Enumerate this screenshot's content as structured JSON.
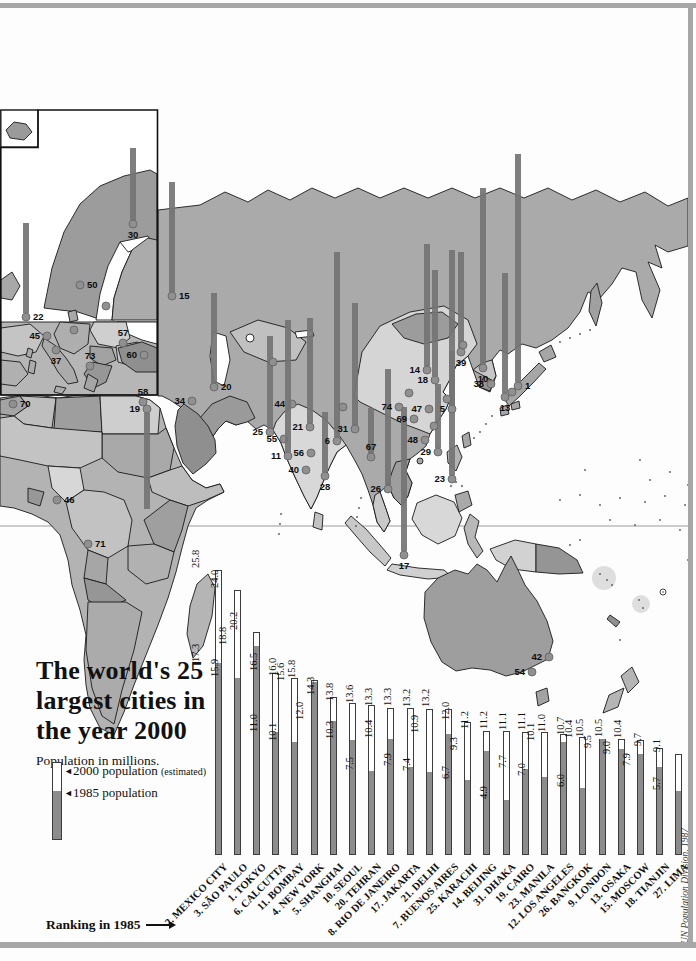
{
  "header": {
    "title_lines": [
      "The world's 25",
      "largest cities in",
      "the year 2000"
    ],
    "subtitle": "Population in millions."
  },
  "legend": {
    "marker": "◄",
    "y2000": "2000 population",
    "y2000_note": "(estimated)",
    "y1985": "1985 population"
  },
  "footnote": {
    "ranking_label": "Ranking in 1985",
    "credit": "UN Population Division, 1987"
  },
  "colors": {
    "frame": "#a7a7a7",
    "land_base": "#aaaaaa",
    "land_light": "#d6d6d6",
    "bar_2000_fill": "#ffffff",
    "bar_1985_fill": "#8c8c8c",
    "bar_outline": "#3c3c3c",
    "map_bar": "#747474",
    "city_dot": "#909090",
    "text": "#111111"
  },
  "chart_data": {
    "type": "bar",
    "title": "The world's 25 largest cities in the year 2000",
    "ylabel": "Population in millions",
    "legend_position": "left",
    "series": [
      {
        "name": "2000 population (estimated)"
      },
      {
        "name": "1985 population"
      }
    ],
    "cities": [
      {
        "label": "2. MEXICO CITY",
        "pop2000": 25.8,
        "pop1985": 17.3
      },
      {
        "label": "3. SÃO PAULO",
        "pop2000": 24.0,
        "pop1985": 15.9
      },
      {
        "label": "1. TOKYO",
        "pop2000": 20.2,
        "pop1985": 18.8
      },
      {
        "label": "6. CALCUTTA",
        "pop2000": 16.5,
        "pop1985": 11.0
      },
      {
        "label": "11. BOMBAY",
        "pop2000": 16.0,
        "pop1985": 10.1
      },
      {
        "label": "4. NEW YORK",
        "pop2000": 15.8,
        "pop1985": 15.6
      },
      {
        "label": "5. SHANGHAI",
        "pop2000": 14.3,
        "pop1985": 12.0
      },
      {
        "label": "10. SEOUL",
        "pop2000": 13.8,
        "pop1985": 10.3
      },
      {
        "label": "20. TEHRAN",
        "pop2000": 13.6,
        "pop1985": 7.5
      },
      {
        "label": "8. RIO DE JANEIRO",
        "pop2000": 13.3,
        "pop1985": 10.4
      },
      {
        "label": "17. JAKARTA",
        "pop2000": 13.3,
        "pop1985": 7.9
      },
      {
        "label": "21. DELHI",
        "pop2000": 13.2,
        "pop1985": 7.4
      },
      {
        "label": "7. BUENOS AIRES",
        "pop2000": 13.2,
        "pop1985": 10.9
      },
      {
        "label": "25. KARACHI",
        "pop2000": 12.0,
        "pop1985": 6.7
      },
      {
        "label": "14. BEIJING",
        "pop2000": 11.2,
        "pop1985": 9.3
      },
      {
        "label": "31. DHAKA",
        "pop2000": 11.2,
        "pop1985": 4.9
      },
      {
        "label": "19. CAIRO",
        "pop2000": 11.1,
        "pop1985": 7.7
      },
      {
        "label": "23. MANILA",
        "pop2000": 11.1,
        "pop1985": 7.0
      },
      {
        "label": "12. LOS ANGELES",
        "pop2000": 11.0,
        "pop1985": 10.1
      },
      {
        "label": "26. BANGKOK",
        "pop2000": 10.7,
        "pop1985": 6.0
      },
      {
        "label": "9. LONDON",
        "pop2000": 10.5,
        "pop1985": 10.4
      },
      {
        "label": "13. OSAKA",
        "pop2000": 10.5,
        "pop1985": 9.5
      },
      {
        "label": "15. MOSCOW",
        "pop2000": 10.4,
        "pop1985": 9.0
      },
      {
        "label": "18. TIANJIN",
        "pop2000": 9.7,
        "pop1985": 7.9
      },
      {
        "label": "27. LIMA",
        "pop2000": 9.1,
        "pop1985": 5.7
      }
    ]
  },
  "map": {
    "markers": [
      {
        "n": "30",
        "x": 133,
        "y": 224,
        "bar": 72,
        "side": "below"
      },
      {
        "n": "22",
        "x": 26,
        "y": 317,
        "bar": 90,
        "side": "right"
      },
      {
        "n": "50",
        "x": 80,
        "y": 285,
        "bar": 0,
        "side": "right"
      },
      {
        "n": "45",
        "x": 47,
        "y": 336,
        "bar": 0,
        "side": "left"
      },
      {
        "n": "37",
        "x": 56,
        "y": 350,
        "bar": 0,
        "side": "below"
      },
      {
        "n": "73",
        "x": 90,
        "y": 366,
        "bar": 0,
        "side": "above"
      },
      {
        "n": "57",
        "x": 123,
        "y": 343,
        "bar": 0,
        "side": "above"
      },
      {
        "n": "60",
        "x": 144,
        "y": 355,
        "bar": 0,
        "side": "left"
      },
      {
        "n": "",
        "x": 74,
        "y": 330,
        "bar": 0,
        "side": "left"
      },
      {
        "n": "",
        "x": 106,
        "y": 306,
        "bar": 0,
        "side": "left"
      },
      {
        "n": "15",
        "x": 172,
        "y": 296,
        "bar": 110,
        "side": "right"
      },
      {
        "n": "58",
        "x": 143,
        "y": 402,
        "bar": 0,
        "side": "above"
      },
      {
        "n": "19",
        "x": 147,
        "y": 409,
        "bar": -96,
        "side": "left"
      },
      {
        "n": "34",
        "x": 192,
        "y": 401,
        "bar": 0,
        "side": "left"
      },
      {
        "n": "70",
        "x": 13,
        "y": 404,
        "bar": 0,
        "side": "right"
      },
      {
        "n": "46",
        "x": 57,
        "y": 500,
        "bar": 0,
        "side": "right"
      },
      {
        "n": "71",
        "x": 88,
        "y": 544,
        "bar": 0,
        "side": "right"
      },
      {
        "n": "20",
        "x": 214,
        "y": 387,
        "bar": 90,
        "side": "right"
      },
      {
        "n": "44",
        "x": 292,
        "y": 404,
        "bar": 0,
        "side": "left"
      },
      {
        "n": "21",
        "x": 310,
        "y": 427,
        "bar": 105,
        "side": "left"
      },
      {
        "n": "25",
        "x": 270,
        "y": 432,
        "bar": 92,
        "side": "left"
      },
      {
        "n": "55",
        "x": 284,
        "y": 439,
        "bar": 0,
        "side": "left"
      },
      {
        "n": "11",
        "x": 288,
        "y": 456,
        "bar": 132,
        "side": "left"
      },
      {
        "n": "56",
        "x": 311,
        "y": 453,
        "bar": 0,
        "side": "left"
      },
      {
        "n": "40",
        "x": 306,
        "y": 470,
        "bar": 0,
        "side": "left"
      },
      {
        "n": "28",
        "x": 325,
        "y": 476,
        "bar": 60,
        "side": "below"
      },
      {
        "n": "6",
        "x": 337,
        "y": 441,
        "bar": 185,
        "side": "left"
      },
      {
        "n": "31",
        "x": 355,
        "y": 429,
        "bar": 122,
        "side": "left"
      },
      {
        "n": "67",
        "x": 371,
        "y": 457,
        "bar": 45,
        "side": "above"
      },
      {
        "n": "26",
        "x": 388,
        "y": 489,
        "bar": 116,
        "side": "left"
      },
      {
        "n": "17",
        "x": 404,
        "y": 555,
        "bar": 144,
        "side": "below"
      },
      {
        "n": "23",
        "x": 452,
        "y": 479,
        "bar": 124,
        "side": "left"
      },
      {
        "n": "29",
        "x": 438,
        "y": 452,
        "bar": 64,
        "side": "left"
      },
      {
        "n": "48",
        "x": 425,
        "y": 440,
        "bar": 0,
        "side": "left"
      },
      {
        "n": "47",
        "x": 429,
        "y": 409,
        "bar": 0,
        "side": "left"
      },
      {
        "n": "69",
        "x": 414,
        "y": 419,
        "bar": 0,
        "side": "left"
      },
      {
        "n": "74",
        "x": 399,
        "y": 407,
        "bar": 0,
        "side": "left"
      },
      {
        "n": "5",
        "x": 452,
        "y": 409,
        "bar": 155,
        "side": "left"
      },
      {
        "n": "14",
        "x": 427,
        "y": 370,
        "bar": 122,
        "side": "left"
      },
      {
        "n": "18",
        "x": 435,
        "y": 380,
        "bar": 106,
        "side": "left"
      },
      {
        "n": "39",
        "x": 461,
        "y": 352,
        "bar": 96,
        "side": "below"
      },
      {
        "n": "10",
        "x": 483,
        "y": 368,
        "bar": 176,
        "side": "below"
      },
      {
        "n": "38",
        "x": 491,
        "y": 384,
        "bar": 0,
        "side": "left"
      },
      {
        "n": "1",
        "x": 518,
        "y": 386,
        "bar": 228,
        "side": "right"
      },
      {
        "n": "13",
        "x": 505,
        "y": 397,
        "bar": 120,
        "side": "below"
      },
      {
        "n": "42",
        "x": 549,
        "y": 657,
        "bar": 0,
        "side": "left"
      },
      {
        "n": "54",
        "x": 532,
        "y": 672,
        "bar": 0,
        "side": "left"
      },
      {
        "n": "",
        "x": 273,
        "y": 362,
        "bar": 0,
        "side": "left"
      },
      {
        "n": "",
        "x": 409,
        "y": 393,
        "bar": 0,
        "side": "left"
      },
      {
        "n": "",
        "x": 447,
        "y": 399,
        "bar": 0,
        "side": "left"
      },
      {
        "n": "",
        "x": 434,
        "y": 426,
        "bar": 0,
        "side": "left"
      },
      {
        "n": "",
        "x": 343,
        "y": 407,
        "bar": 0,
        "side": "left"
      },
      {
        "n": "",
        "x": 512,
        "y": 392,
        "bar": 0,
        "side": "left"
      },
      {
        "n": "",
        "x": 463,
        "y": 345,
        "bar": 0,
        "side": "left"
      }
    ]
  }
}
